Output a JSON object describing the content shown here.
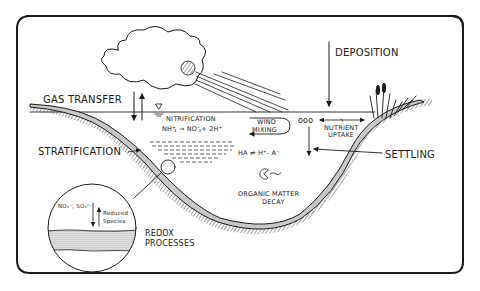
{
  "diagram": {
    "type": "lake-biogeochemical-processes",
    "labels": {
      "gas_transfer": "GAS TRANSFER",
      "deposition": "DEPOSITION",
      "nitrification": "NITRIFICATION",
      "nitrification_eq_left": "NH",
      "nitrification_eq_arrow": "→",
      "nitrification_eq_right": "NO",
      "nitrification_eq_tail": "+ 2H",
      "wind_mixing_1": "WIND",
      "wind_mixing_2": "MIXING",
      "nutrient_uptake_1": "NUTRIENT",
      "nutrient_uptake_2": "UPTAKE",
      "stratification": "STRATIFICATION",
      "acid_eq": "HA ⇌ H⁺- A⁻",
      "settling": "SETTLING",
      "organic_1": "ORGANIC MATTER",
      "organic_2": "DECAY",
      "redox_1": "REDOX",
      "redox_2": "PROCESSES",
      "inset_species": "NO₃⁻, SO₄²⁻",
      "inset_reduced_1": "Reduced",
      "inset_reduced_2": "Species",
      "phytoplankton": "ooo"
    }
  }
}
